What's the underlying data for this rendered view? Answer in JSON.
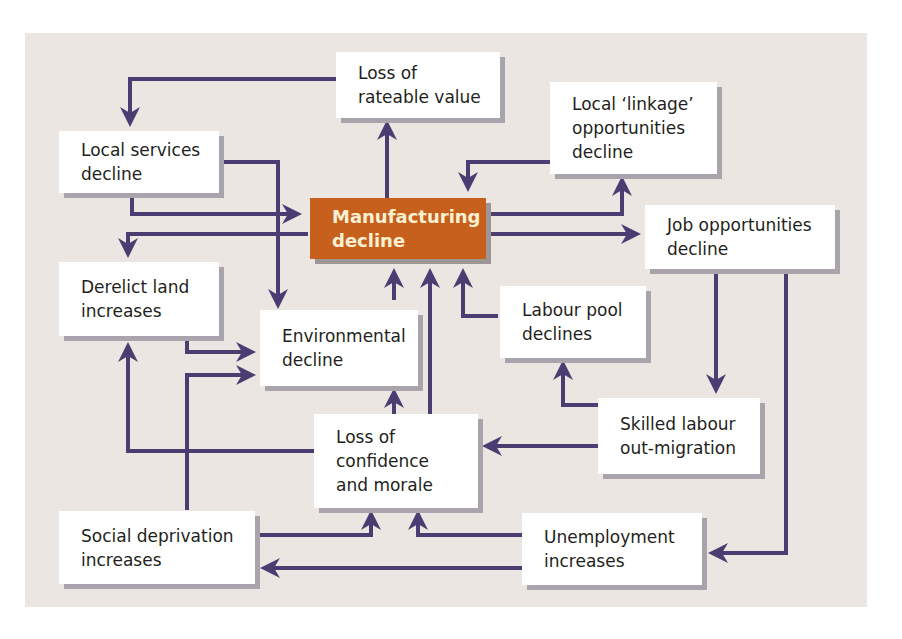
{
  "diagram": {
    "colors": {
      "panel": "#ece6e3",
      "arrow": "#4a3d72",
      "box": "#ffffff",
      "core": "#c8601d",
      "core_text": "#fbf0d2",
      "shadow": "#a9a4ab"
    },
    "nodes": {
      "loss_rateable": "Loss of\nrateable value",
      "local_linkage": "Local ‘linkage’\nopportunities\ndecline",
      "local_services": "Local services\ndecline",
      "manufacturing": "Manufacturing\ndecline",
      "job_opps": "Job opportunities\ndecline",
      "derelict": "Derelict land\nincreases",
      "environmental": "Environmental\ndecline",
      "labour_pool": "Labour pool\ndeclines",
      "skilled_labour": "Skilled labour\nout-migration",
      "confidence": "Loss of\nconfidence\nand morale",
      "social_dep": "Social deprivation\nincreases",
      "unemployment": "Unemployment\nincreases"
    },
    "edges": [
      [
        "manufacturing",
        "loss_rateable"
      ],
      [
        "loss_rateable",
        "local_services"
      ],
      [
        "manufacturing",
        "local_linkage"
      ],
      [
        "local_linkage",
        "manufacturing"
      ],
      [
        "local_services",
        "manufacturing"
      ],
      [
        "local_services",
        "environmental"
      ],
      [
        "manufacturing",
        "derelict"
      ],
      [
        "manufacturing",
        "job_opps"
      ],
      [
        "derelict",
        "environmental"
      ],
      [
        "environmental",
        "manufacturing"
      ],
      [
        "labour_pool",
        "manufacturing"
      ],
      [
        "confidence",
        "manufacturing"
      ],
      [
        "confidence",
        "environmental"
      ],
      [
        "confidence",
        "derelict"
      ],
      [
        "social_dep",
        "environmental"
      ],
      [
        "social_dep",
        "confidence"
      ],
      [
        "job_opps",
        "skilled_labour"
      ],
      [
        "job_opps",
        "unemployment"
      ],
      [
        "skilled_labour",
        "labour_pool"
      ],
      [
        "skilled_labour",
        "confidence"
      ],
      [
        "unemployment",
        "confidence"
      ],
      [
        "unemployment",
        "social_dep"
      ]
    ]
  }
}
